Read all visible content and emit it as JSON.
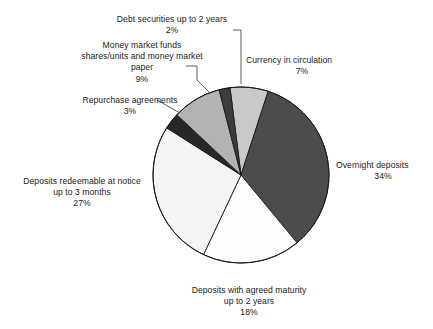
{
  "chart_data": {
    "type": "pie",
    "title": "",
    "subtitle": "",
    "xlabel": "",
    "ylabel": "",
    "legend_position": "none",
    "grid": false,
    "value_unit": "%",
    "total": 100,
    "start_angle_deg": 0,
    "direction": "clockwise",
    "categories": [
      "Currency in circulation",
      "Overnight deposits",
      "Deposits with agreed maturity up to 2 years",
      "Deposits redeemable at notice up to 3 months",
      "Repurchase agreements",
      "Money market funds shares/units and money market paper",
      "Debt securities up to 2 years"
    ],
    "values": [
      7,
      34,
      18,
      27,
      3,
      9,
      2
    ],
    "slice_colors": [
      "#c9c9c9",
      "#4c4c4c",
      "#fdfdfd",
      "#f4f4f4",
      "#272727",
      "#b3b3b3",
      "#3d3d3d"
    ],
    "slices": [
      {
        "id": "currency-in-circulation",
        "label_lines": [
          "Currency in circulation"
        ],
        "percent_text": "7%",
        "value": 7,
        "color": "#c9c9c9"
      },
      {
        "id": "overnight-deposits",
        "label_lines": [
          "Overnight deposits"
        ],
        "percent_text": "34%",
        "value": 34,
        "color": "#4c4c4c"
      },
      {
        "id": "deposits-agreed-maturity",
        "label_lines": [
          "Deposits with agreed maturity",
          "up to 2 years"
        ],
        "percent_text": "18%",
        "value": 18,
        "color": "#fdfdfd"
      },
      {
        "id": "deposits-redeemable-at-notice",
        "label_lines": [
          "Deposits redeemable at notice",
          "up to 3 months"
        ],
        "percent_text": "27%",
        "value": 27,
        "color": "#f4f4f4"
      },
      {
        "id": "repurchase-agreements",
        "label_lines": [
          "Repurchase agreements"
        ],
        "percent_text": "3%",
        "value": 3,
        "color": "#272727"
      },
      {
        "id": "money-market-funds",
        "label_lines": [
          "Money market funds",
          "shares/units and money market",
          "paper"
        ],
        "percent_text": "9%",
        "value": 9,
        "color": "#b3b3b3"
      },
      {
        "id": "debt-securities",
        "label_lines": [
          "Debt securities up to 2 years"
        ],
        "percent_text": "2%",
        "value": 2,
        "color": "#3d3d3d"
      }
    ]
  },
  "labels": {
    "debt_securities": {
      "line1": "Debt securities up to 2 years",
      "percent": "2%"
    },
    "money_market_funds": {
      "line1": "Money market funds",
      "line2": "shares/units and money market",
      "line3": "paper",
      "percent": "9%"
    },
    "repurchase_agreements": {
      "line1": "Repurchase agreements",
      "percent": "3%"
    },
    "deposits_redeemable": {
      "line1": "Deposits redeemable at notice",
      "line2": "up to 3 months",
      "percent": "27%"
    },
    "deposits_agreed_maturity": {
      "line1": "Deposits with agreed maturity",
      "line2": "up to 2 years",
      "percent": "18%"
    },
    "currency_in_circulation": {
      "line1": "Currency in circulation",
      "percent": "7%"
    },
    "overnight_deposits": {
      "line1": "Overnight deposits",
      "percent": "34%"
    }
  },
  "colors": {
    "background": "#ffffff",
    "outline": "#1a1a1a",
    "text": "#1a1a1a",
    "leader_line": "#4a4a4a"
  }
}
